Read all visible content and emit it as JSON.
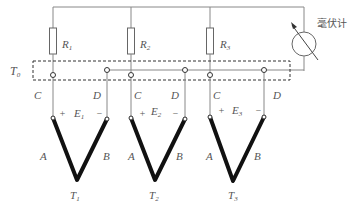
{
  "diagram": {
    "type": "circuit",
    "meter_label": "毫伏计",
    "reference_temperature_label": "T",
    "reference_temperature_sub": "0",
    "resistors": [
      {
        "label": "R",
        "sub": "1"
      },
      {
        "label": "R",
        "sub": "2"
      },
      {
        "label": "R",
        "sub": "3"
      }
    ],
    "thermocouples": [
      {
        "c_label": "C",
        "d_label": "D",
        "plus": "+",
        "minus": "−",
        "emf": "E",
        "emf_sub": "1",
        "a_label": "A",
        "b_label": "B",
        "temp": "T",
        "temp_sub": "1"
      },
      {
        "c_label": "C",
        "d_label": "D",
        "plus": "+",
        "minus": "−",
        "emf": "E",
        "emf_sub": "2",
        "a_label": "A",
        "b_label": "B",
        "temp": "T",
        "temp_sub": "2"
      },
      {
        "c_label": "C",
        "d_label": "D",
        "plus": "+",
        "minus": "−",
        "emf": "E",
        "emf_sub": "3",
        "a_label": "A",
        "b_label": "B",
        "temp": "T",
        "temp_sub": "3"
      }
    ],
    "colors": {
      "wire": "#888888",
      "thermocouple": "#111111",
      "label": "#555555"
    }
  }
}
